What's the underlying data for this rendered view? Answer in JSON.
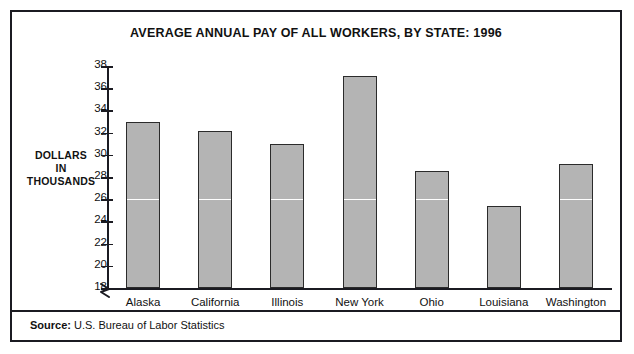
{
  "chart_data": {
    "type": "bar",
    "title": "AVERAGE ANNUAL PAY OF ALL WORKERS, BY STATE: 1996",
    "categories": [
      "Alaska",
      "California",
      "Illinois",
      "New York",
      "Ohio",
      "Louisiana",
      "Washington"
    ],
    "values": [
      33.0,
      32.1,
      31.0,
      37.1,
      28.5,
      25.4,
      29.2
    ],
    "xlabel": "",
    "ylabel": "DOLLARS IN THOUSANDS",
    "ylabel_lines": [
      "DOLLARS",
      "IN",
      "THOUSANDS"
    ],
    "ylim": [
      18,
      38
    ],
    "ytick_values": [
      38,
      36,
      34,
      32,
      30,
      28,
      26,
      24,
      22,
      20,
      18
    ],
    "ytick_labels": [
      "38",
      "36",
      "34",
      "32",
      "30",
      "28",
      "26",
      "24",
      "22",
      "20",
      "18"
    ],
    "axis_break": true,
    "axis_break_at": 18,
    "grid": false,
    "gridline_values": [
      26
    ],
    "gridline_color": "#ffffff",
    "legend": null,
    "bar_color": "#b4b4b4",
    "bar_edge_color": "#2b2b2b",
    "units": "thousands of dollars"
  },
  "footer": {
    "source_label": "Source:",
    "source_text": "U.S. Bureau of Labor Statistics"
  }
}
